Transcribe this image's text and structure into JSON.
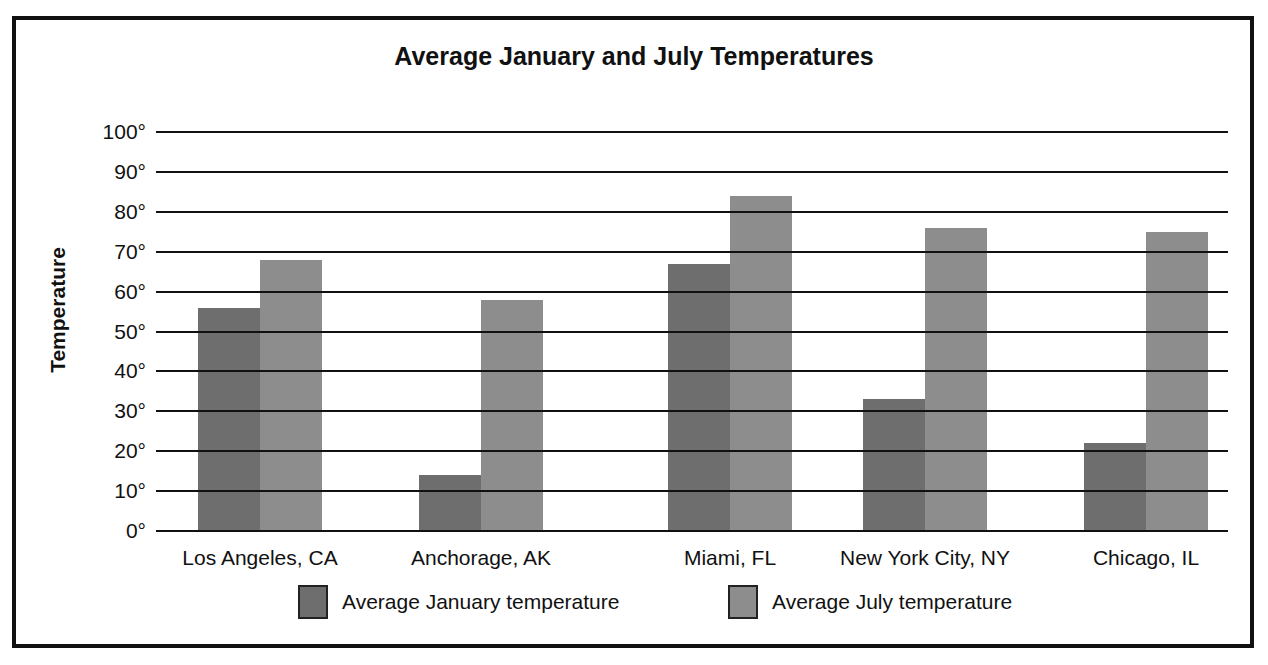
{
  "chart_data": {
    "type": "bar",
    "title": "Average January and July Temperatures",
    "xlabel": "",
    "ylabel": "Temperature",
    "ylim": [
      0,
      100
    ],
    "yticks": [
      "0°",
      "10°",
      "20°",
      "30°",
      "40°",
      "50°",
      "60°",
      "70°",
      "80°",
      "90°",
      "100°"
    ],
    "grid": true,
    "legend_position": "bottom",
    "categories": [
      "Los Angeles, CA",
      "Anchorage, AK",
      "Miami, FL",
      "New York City, NY",
      "Chicago, IL"
    ],
    "series": [
      {
        "name": "Average January temperature",
        "color": "#6e6e6e",
        "values": [
          56,
          14,
          67,
          33,
          22
        ]
      },
      {
        "name": "Average July temperature",
        "color": "#8d8d8d",
        "values": [
          68,
          58,
          84,
          76,
          75
        ]
      }
    ]
  }
}
